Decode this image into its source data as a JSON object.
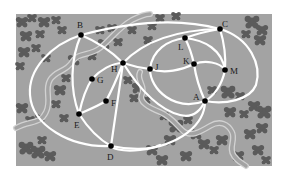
{
  "map": {
    "background_color": "#ffffff",
    "field": {
      "x": 16,
      "y": 14,
      "width": 256,
      "height": 152,
      "color": "#a3a3a3"
    },
    "colors": {
      "path": "#ffffff",
      "tree": "#5b5b5b",
      "stream_outline": "#d2d2d2",
      "stream_fill": "#a3a3a3",
      "node": "#000000",
      "label": "#1a1a1a"
    },
    "nodes": [
      {
        "id": "A",
        "label": "A",
        "x": 205,
        "y": 101,
        "lx": 193,
        "ly": 100
      },
      {
        "id": "B",
        "label": "B",
        "x": 81,
        "y": 35,
        "lx": 77,
        "ly": 28
      },
      {
        "id": "C",
        "label": "C",
        "x": 220,
        "y": 29,
        "lx": 222,
        "ly": 27
      },
      {
        "id": "D",
        "label": "D",
        "x": 111,
        "y": 146,
        "lx": 107,
        "ly": 160
      },
      {
        "id": "E",
        "label": "E",
        "x": 79,
        "y": 114,
        "lx": 74,
        "ly": 128
      },
      {
        "id": "F",
        "label": "F",
        "x": 106,
        "y": 101,
        "lx": 111,
        "ly": 106
      },
      {
        "id": "G",
        "label": "G",
        "x": 92,
        "y": 79,
        "lx": 97,
        "ly": 83
      },
      {
        "id": "H",
        "label": "H",
        "x": 123,
        "y": 63,
        "lx": 111,
        "ly": 72
      },
      {
        "id": "J",
        "label": "J",
        "x": 150,
        "y": 69,
        "lx": 155,
        "ly": 70
      },
      {
        "id": "K",
        "label": "K",
        "x": 194,
        "y": 64,
        "lx": 183,
        "ly": 64
      },
      {
        "id": "L",
        "label": "L",
        "x": 185,
        "y": 38,
        "lx": 178,
        "ly": 50
      },
      {
        "id": "M",
        "label": "M",
        "x": 225,
        "y": 70,
        "lx": 230,
        "ly": 74
      }
    ],
    "paths": [
      {
        "name": "path-B-C-top",
        "d": "M81,35 C130,22 180,18 220,29"
      },
      {
        "name": "path-B-H",
        "d": "M81,35 C98,42 112,52 123,63"
      },
      {
        "name": "path-B-E",
        "d": "M81,35 C70,60 70,90 79,114"
      },
      {
        "name": "path-outer-left-loop",
        "d": "M81,35 C50,45 28,70 30,95 C32,125 70,148 111,146"
      },
      {
        "name": "path-E-D",
        "d": "M79,114 C88,128 100,140 111,146"
      },
      {
        "name": "path-E-F",
        "d": "M79,114 C88,110 98,106 106,101"
      },
      {
        "name": "path-F-H",
        "d": "M106,101 C112,90 118,76 123,63"
      },
      {
        "name": "path-E-G",
        "d": "M79,114 C82,100 86,88 92,79"
      },
      {
        "name": "path-G-H-arc",
        "d": "M92,79 C100,70 112,63 123,63"
      },
      {
        "name": "path-H-D",
        "d": "M123,63 C119,90 115,120 111,146"
      },
      {
        "name": "path-H-J",
        "d": "M123,63 C132,66 141,68 150,69"
      },
      {
        "name": "path-H-arc-right",
        "d": "M123,63 C140,90 160,110 180,115 C192,118 200,112 205,101"
      },
      {
        "name": "path-J-L",
        "d": "M150,69 C152,50 168,40 185,38"
      },
      {
        "name": "path-J-A",
        "d": "M150,69 C150,90 175,112 205,101"
      },
      {
        "name": "path-J-K",
        "d": "M150,69 C165,74 182,70 194,64"
      },
      {
        "name": "path-L-C",
        "d": "M185,38 C196,34 208,31 220,29"
      },
      {
        "name": "path-L-K",
        "d": "M185,38 C189,46 192,55 194,64"
      },
      {
        "name": "path-L-M",
        "d": "M185,38 C205,40 222,50 225,70"
      },
      {
        "name": "path-K-M",
        "d": "M194,64 C205,60 220,62 225,70"
      },
      {
        "name": "path-K-A",
        "d": "M194,64 C196,78 200,90 205,101"
      },
      {
        "name": "path-C-M",
        "d": "M220,29 C224,42 226,56 225,70"
      },
      {
        "name": "path-M-A",
        "d": "M225,70 C222,85 214,96 205,101"
      },
      {
        "name": "path-C-outer-right",
        "d": "M220,29 C250,38 262,65 256,85 C250,100 225,105 205,101"
      },
      {
        "name": "path-A-down",
        "d": "M205,101 C205,125 180,145 140,150 C120,152 112,148 111,146"
      },
      {
        "name": "path-top-edge-left",
        "d": "M123,63 C140,45 170,30 220,29"
      },
      {
        "name": "path-D-outer-bottom",
        "d": "M111,146 C130,150 150,150 160,145"
      }
    ],
    "streams": [
      {
        "name": "stream-left",
        "d": "M16,128 C30,120 40,125 46,112 C52,100 44,90 50,80 C56,70 66,72 72,62 C78,52 90,56 100,48 C112,38 118,28 132,20 C140,16 146,14 150,14"
      },
      {
        "name": "stream-center",
        "d": "M140,72 C136,80 146,86 142,94 C138,102 150,108 160,112 C170,116 176,124 182,130 C190,138 200,132 210,126 C220,120 228,124 232,132 C236,140 228,148 234,156 C238,162 244,164 246,166"
      }
    ],
    "trees": [
      [
        22,
        22,
        5
      ],
      [
        32,
        18,
        4
      ],
      [
        44,
        22,
        5
      ],
      [
        56,
        20,
        4
      ],
      [
        26,
        36,
        5
      ],
      [
        40,
        34,
        4
      ],
      [
        62,
        30,
        4
      ],
      [
        24,
        52,
        5
      ],
      [
        36,
        48,
        4
      ],
      [
        20,
        66,
        4
      ],
      [
        46,
        58,
        4
      ],
      [
        22,
        108,
        5
      ],
      [
        30,
        120,
        4
      ],
      [
        40,
        118,
        4
      ],
      [
        26,
        148,
        6
      ],
      [
        38,
        152,
        6
      ],
      [
        50,
        156,
        5
      ],
      [
        42,
        140,
        4
      ],
      [
        100,
        30,
        4
      ],
      [
        112,
        28,
        4
      ],
      [
        104,
        44,
        5
      ],
      [
        118,
        42,
        4
      ],
      [
        92,
        56,
        4
      ],
      [
        74,
        60,
        5
      ],
      [
        66,
        78,
        4
      ],
      [
        60,
        90,
        5
      ],
      [
        56,
        104,
        4
      ],
      [
        64,
        118,
        4
      ],
      [
        132,
        30,
        4
      ],
      [
        152,
        26,
        4
      ],
      [
        160,
        18,
        4
      ],
      [
        176,
        16,
        4
      ],
      [
        148,
        40,
        4
      ],
      [
        128,
        80,
        4
      ],
      [
        138,
        88,
        5
      ],
      [
        134,
        98,
        4
      ],
      [
        146,
        100,
        4
      ],
      [
        252,
        22,
        6
      ],
      [
        262,
        30,
        5
      ],
      [
        246,
        34,
        4
      ],
      [
        260,
        40,
        5
      ],
      [
        228,
        92,
        6
      ],
      [
        240,
        96,
        4
      ],
      [
        212,
        90,
        4
      ],
      [
        164,
        116,
        4
      ],
      [
        176,
        126,
        6
      ],
      [
        188,
        120,
        4
      ],
      [
        196,
        134,
        5
      ],
      [
        170,
        140,
        5
      ],
      [
        152,
        150,
        5
      ],
      [
        162,
        160,
        5
      ],
      [
        186,
        156,
        5
      ],
      [
        204,
        144,
        5
      ],
      [
        214,
        150,
        4
      ],
      [
        230,
        112,
        5
      ],
      [
        244,
        114,
        4
      ],
      [
        254,
        106,
        5
      ],
      [
        264,
        112,
        6
      ],
      [
        262,
        128,
        5
      ],
      [
        250,
        134,
        5
      ],
      [
        222,
        140,
        5
      ],
      [
        238,
        156,
        5
      ],
      [
        258,
        150,
        5
      ],
      [
        266,
        160,
        4
      ]
    ]
  }
}
